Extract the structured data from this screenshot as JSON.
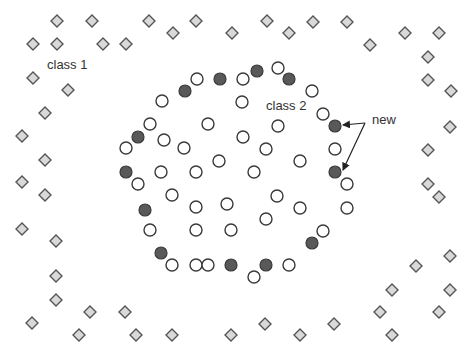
{
  "diagram": {
    "type": "scatter-illustration",
    "labels": {
      "class1": {
        "text": "class 1",
        "x": 47,
        "y": 69
      },
      "class2": {
        "text": "class 2",
        "x": 266,
        "y": 110
      },
      "new": {
        "text": "new",
        "x": 372,
        "y": 124
      }
    },
    "colors": {
      "diamond_fill": "#d9d9d9",
      "diamond_stroke": "#555555",
      "open_circle_fill": "#ffffff",
      "filled_circle_fill": "#595959",
      "circle_stroke": "#3a3a3a",
      "arrow": "#222222"
    },
    "class1_diamonds": [
      [
        57,
        21
      ],
      [
        92,
        21
      ],
      [
        149,
        21
      ],
      [
        196,
        21
      ],
      [
        267,
        21
      ],
      [
        313,
        22
      ],
      [
        347,
        22
      ],
      [
        33,
        44
      ],
      [
        57,
        44
      ],
      [
        103,
        44
      ],
      [
        126,
        44
      ],
      [
        173,
        33
      ],
      [
        232,
        33
      ],
      [
        289,
        33
      ],
      [
        370,
        45
      ],
      [
        405,
        33
      ],
      [
        439,
        33
      ],
      [
        428,
        57
      ],
      [
        33,
        78
      ],
      [
        68,
        90
      ],
      [
        428,
        80
      ],
      [
        451,
        91
      ],
      [
        45,
        113
      ],
      [
        22,
        136
      ],
      [
        450,
        127
      ],
      [
        45,
        160
      ],
      [
        428,
        150
      ],
      [
        22,
        182
      ],
      [
        45,
        195
      ],
      [
        428,
        184
      ],
      [
        439,
        197
      ],
      [
        22,
        229
      ],
      [
        56,
        241
      ],
      [
        450,
        256
      ],
      [
        416,
        266
      ],
      [
        56,
        276
      ],
      [
        392,
        290
      ],
      [
        450,
        290
      ],
      [
        56,
        300
      ],
      [
        90,
        312
      ],
      [
        125,
        312
      ],
      [
        380,
        312
      ],
      [
        439,
        312
      ],
      [
        32,
        323
      ],
      [
        265,
        324
      ],
      [
        334,
        324
      ],
      [
        79,
        335
      ],
      [
        136,
        335
      ],
      [
        172,
        335
      ],
      [
        231,
        335
      ],
      [
        300,
        335
      ],
      [
        392,
        335
      ]
    ],
    "class2_open_circles": [
      [
        197,
        79
      ],
      [
        243,
        79
      ],
      [
        278,
        68
      ],
      [
        162,
        101
      ],
      [
        242,
        102
      ],
      [
        312,
        91
      ],
      [
        323,
        114
      ],
      [
        150,
        124
      ],
      [
        208,
        124
      ],
      [
        278,
        126
      ],
      [
        164,
        140
      ],
      [
        184,
        148
      ],
      [
        243,
        137
      ],
      [
        266,
        149
      ],
      [
        126,
        148
      ],
      [
        335,
        149
      ],
      [
        219,
        161
      ],
      [
        300,
        161
      ],
      [
        161,
        172
      ],
      [
        196,
        172
      ],
      [
        254,
        172
      ],
      [
        138,
        184
      ],
      [
        347,
        184
      ],
      [
        172,
        195
      ],
      [
        277,
        196
      ],
      [
        196,
        207
      ],
      [
        227,
        204
      ],
      [
        300,
        208
      ],
      [
        347,
        208
      ],
      [
        266,
        219
      ],
      [
        150,
        230
      ],
      [
        196,
        230
      ],
      [
        231,
        230
      ],
      [
        323,
        231
      ],
      [
        172,
        265
      ],
      [
        196,
        265
      ],
      [
        208,
        265
      ],
      [
        289,
        265
      ],
      [
        254,
        277
      ]
    ],
    "new_filled_circles": [
      [
        185,
        91
      ],
      [
        220,
        79
      ],
      [
        257,
        71
      ],
      [
        289,
        79
      ],
      [
        138,
        137
      ],
      [
        335,
        126
      ],
      [
        126,
        172
      ],
      [
        335,
        172
      ],
      [
        145,
        210
      ],
      [
        161,
        253
      ],
      [
        312,
        243
      ],
      [
        231,
        265
      ],
      [
        266,
        265
      ]
    ],
    "arrows": [
      {
        "from": [
          365,
          123
        ],
        "to": [
          343,
          125
        ]
      },
      {
        "from": [
          365,
          123
        ],
        "to": [
          343,
          170
        ]
      }
    ],
    "marker_sizes": {
      "diamond_half": 6,
      "circle_radius": 6
    }
  }
}
